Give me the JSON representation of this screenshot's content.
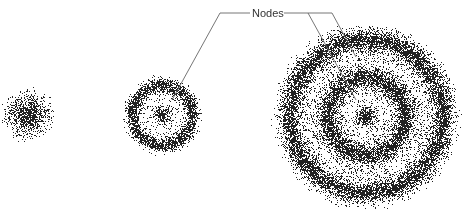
{
  "diagram": {
    "title": "",
    "annotation_label": "Nodes",
    "orbitals": [
      {
        "name": "1s",
        "cx": 28,
        "cy": 115,
        "radius": 30,
        "nodes": 0
      },
      {
        "name": "2s",
        "cx": 162,
        "cy": 115,
        "radius": 42,
        "nodes": 1
      },
      {
        "name": "3s",
        "cx": 366,
        "cy": 116,
        "radius": 96,
        "nodes": 2
      }
    ],
    "colors": {
      "dots": "#222222",
      "lines": "#555555",
      "text": "#333333"
    }
  }
}
